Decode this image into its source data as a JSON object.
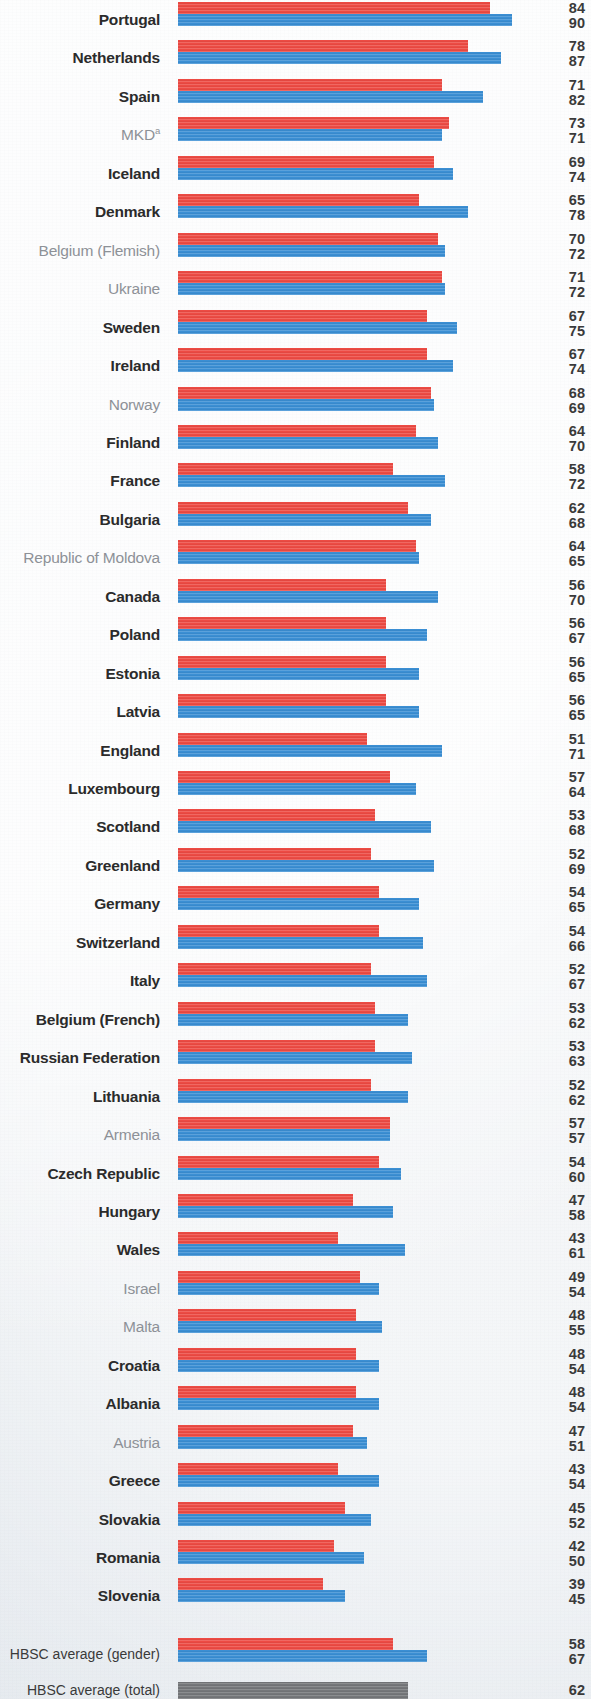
{
  "chart_data": {
    "type": "bar",
    "orientation": "horizontal",
    "title": "",
    "xlabel": "",
    "ylabel": "",
    "xlim": [
      0,
      100
    ],
    "grid": false,
    "legend_position": "none",
    "series": [
      {
        "name": "Boys",
        "color": "#ed4b44"
      },
      {
        "name": "Girls",
        "color": "#3b8fd4"
      }
    ],
    "colors": {
      "series_1": "#ed4b44",
      "series_2": "#3b8fd4",
      "total": "#75777a",
      "label_bold": "#2b2b2b",
      "label_light": "#8d9197",
      "background": "#eef1f4"
    },
    "categories": [
      "Portugal",
      "Netherlands",
      "Spain",
      "MKD",
      "Iceland",
      "Denmark",
      "Belgium (Flemish)",
      "Ukraine",
      "Sweden",
      "Ireland",
      "Norway",
      "Finland",
      "France",
      "Bulgaria",
      "Republic of Moldova",
      "Canada",
      "Poland",
      "Estonia",
      "Latvia",
      "England",
      "Luxembourg",
      "Scotland",
      "Greenland",
      "Germany",
      "Switzerland",
      "Italy",
      "Belgium (French)",
      "Russian Federation",
      "Lithuania",
      "Armenia",
      "Czech Republic",
      "Hungary",
      "Wales",
      "Israel",
      "Malta",
      "Croatia",
      "Albania",
      "Austria",
      "Greece",
      "Slovakia",
      "Romania",
      "Slovenia"
    ],
    "rows": [
      {
        "label": "Portugal",
        "emphasis": "bold",
        "footnote": "",
        "v1": 84,
        "v2": 90
      },
      {
        "label": "Netherlands",
        "emphasis": "bold",
        "footnote": "",
        "v1": 78,
        "v2": 87
      },
      {
        "label": "Spain",
        "emphasis": "bold",
        "footnote": "",
        "v1": 71,
        "v2": 82
      },
      {
        "label": "MKD",
        "emphasis": "light",
        "footnote": "a",
        "v1": 73,
        "v2": 71
      },
      {
        "label": "Iceland",
        "emphasis": "bold",
        "footnote": "",
        "v1": 69,
        "v2": 74
      },
      {
        "label": "Denmark",
        "emphasis": "bold",
        "footnote": "",
        "v1": 65,
        "v2": 78
      },
      {
        "label": "Belgium (Flemish)",
        "emphasis": "light",
        "footnote": "",
        "v1": 70,
        "v2": 72
      },
      {
        "label": "Ukraine",
        "emphasis": "light",
        "footnote": "",
        "v1": 71,
        "v2": 72
      },
      {
        "label": "Sweden",
        "emphasis": "bold",
        "footnote": "",
        "v1": 67,
        "v2": 75
      },
      {
        "label": "Ireland",
        "emphasis": "bold",
        "footnote": "",
        "v1": 67,
        "v2": 74
      },
      {
        "label": "Norway",
        "emphasis": "light",
        "footnote": "",
        "v1": 68,
        "v2": 69
      },
      {
        "label": "Finland",
        "emphasis": "bold",
        "footnote": "",
        "v1": 64,
        "v2": 70
      },
      {
        "label": "France",
        "emphasis": "bold",
        "footnote": "",
        "v1": 58,
        "v2": 72
      },
      {
        "label": "Bulgaria",
        "emphasis": "bold",
        "footnote": "",
        "v1": 62,
        "v2": 68
      },
      {
        "label": "Republic of Moldova",
        "emphasis": "light",
        "footnote": "",
        "v1": 64,
        "v2": 65
      },
      {
        "label": "Canada",
        "emphasis": "bold",
        "footnote": "",
        "v1": 56,
        "v2": 70
      },
      {
        "label": "Poland",
        "emphasis": "bold",
        "footnote": "",
        "v1": 56,
        "v2": 67
      },
      {
        "label": "Estonia",
        "emphasis": "bold",
        "footnote": "",
        "v1": 56,
        "v2": 65
      },
      {
        "label": "Latvia",
        "emphasis": "bold",
        "footnote": "",
        "v1": 56,
        "v2": 65
      },
      {
        "label": "England",
        "emphasis": "bold",
        "footnote": "",
        "v1": 51,
        "v2": 71
      },
      {
        "label": "Luxembourg",
        "emphasis": "bold",
        "footnote": "",
        "v1": 57,
        "v2": 64
      },
      {
        "label": "Scotland",
        "emphasis": "bold",
        "footnote": "",
        "v1": 53,
        "v2": 68
      },
      {
        "label": "Greenland",
        "emphasis": "bold",
        "footnote": "",
        "v1": 52,
        "v2": 69
      },
      {
        "label": "Germany",
        "emphasis": "bold",
        "footnote": "",
        "v1": 54,
        "v2": 65
      },
      {
        "label": "Switzerland",
        "emphasis": "bold",
        "footnote": "",
        "v1": 54,
        "v2": 66
      },
      {
        "label": "Italy",
        "emphasis": "bold",
        "footnote": "",
        "v1": 52,
        "v2": 67
      },
      {
        "label": "Belgium (French)",
        "emphasis": "bold",
        "footnote": "",
        "v1": 53,
        "v2": 62
      },
      {
        "label": "Russian Federation",
        "emphasis": "bold",
        "footnote": "",
        "v1": 53,
        "v2": 63
      },
      {
        "label": "Lithuania",
        "emphasis": "bold",
        "footnote": "",
        "v1": 52,
        "v2": 62
      },
      {
        "label": "Armenia",
        "emphasis": "light",
        "footnote": "",
        "v1": 57,
        "v2": 57
      },
      {
        "label": "Czech Republic",
        "emphasis": "bold",
        "footnote": "",
        "v1": 54,
        "v2": 60
      },
      {
        "label": "Hungary",
        "emphasis": "bold",
        "footnote": "",
        "v1": 47,
        "v2": 58
      },
      {
        "label": "Wales",
        "emphasis": "bold",
        "footnote": "",
        "v1": 43,
        "v2": 61
      },
      {
        "label": "Israel",
        "emphasis": "light",
        "footnote": "",
        "v1": 49,
        "v2": 54
      },
      {
        "label": "Malta",
        "emphasis": "light",
        "footnote": "",
        "v1": 48,
        "v2": 55
      },
      {
        "label": "Croatia",
        "emphasis": "bold",
        "footnote": "",
        "v1": 48,
        "v2": 54
      },
      {
        "label": "Albania",
        "emphasis": "bold",
        "footnote": "",
        "v1": 48,
        "v2": 54
      },
      {
        "label": "Austria",
        "emphasis": "light",
        "footnote": "",
        "v1": 47,
        "v2": 51
      },
      {
        "label": "Greece",
        "emphasis": "bold",
        "footnote": "",
        "v1": 43,
        "v2": 54
      },
      {
        "label": "Slovakia",
        "emphasis": "bold",
        "footnote": "",
        "v1": 45,
        "v2": 52
      },
      {
        "label": "Romania",
        "emphasis": "bold",
        "footnote": "",
        "v1": 42,
        "v2": 50
      },
      {
        "label": "Slovenia",
        "emphasis": "bold",
        "footnote": "",
        "v1": 39,
        "v2": 45
      }
    ],
    "summary": [
      {
        "label": "HBSC average (gender)",
        "kind": "pair",
        "v1": 58,
        "v2": 67
      },
      {
        "label": "HBSC average (total)",
        "kind": "total",
        "v1": 62
      }
    ]
  }
}
